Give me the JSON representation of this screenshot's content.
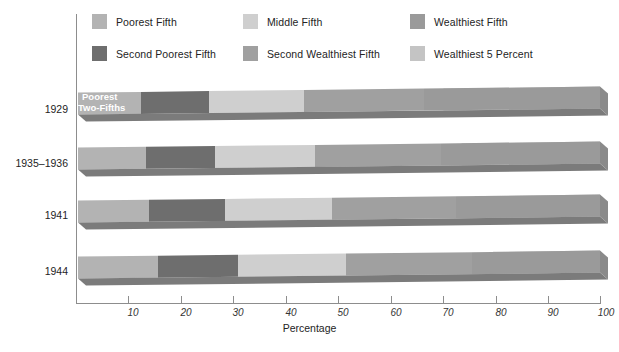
{
  "chart_data": {
    "type": "bar",
    "orientation": "horizontal-stacked-3d",
    "title": "",
    "xlabel": "Percentage",
    "ylabel": "",
    "xlim": [
      0,
      100
    ],
    "xticks": [
      10,
      20,
      30,
      40,
      50,
      60,
      70,
      80,
      90,
      100
    ],
    "grid": false,
    "legend_position": "top",
    "categories": [
      "1929",
      "1935–1936",
      "1941",
      "1944"
    ],
    "series": [
      {
        "name": "Poorest Fifth",
        "color": "#b3b3b3",
        "values": [
          12.0,
          13.0,
          13.5,
          15.0
        ]
      },
      {
        "name": "Second Poorest Fifth",
        "color": "#6e6e6e",
        "values": [
          13.0,
          13.0,
          14.5,
          15.0
        ]
      },
      {
        "name": "Middle Fifth",
        "color": "#cfcfcf",
        "values": [
          18.0,
          19.0,
          20.5,
          20.5
        ]
      },
      {
        "name": "Second Wealthiest Fifth",
        "color": "#a0a0a0",
        "values": [
          23.0,
          24.0,
          23.5,
          24.5
        ]
      },
      {
        "name": "Wealthiest Fifth",
        "color": "#9a9a9a",
        "values": [
          34.0,
          31.0,
          28.0,
          25.0
        ]
      }
    ],
    "overlay_series": {
      "name": "Wealthiest 5 Percent",
      "color": "#c4c4c4",
      "note": "shown as the lighter right-hand portion inside the Wealthiest Fifth band",
      "values": [
        30.0,
        26.5,
        24.0,
        20.5
      ]
    },
    "annotations": [
      {
        "text": "Poorest\nTwo-Fifths",
        "line1": "Poorest",
        "line2": "Two-Fifths",
        "attached_to": "1929",
        "color": "#ffffff"
      }
    ]
  },
  "legend": {
    "items": [
      {
        "label": "Poorest Fifth",
        "color": "#b3b3b3",
        "row": 0,
        "col": 0
      },
      {
        "label": "Middle Fifth",
        "color": "#cfcfcf",
        "row": 0,
        "col": 1
      },
      {
        "label": "Wealthiest Fifth",
        "color": "#9a9a9a",
        "row": 0,
        "col": 2
      },
      {
        "label": "Second Poorest Fifth",
        "color": "#6e6e6e",
        "row": 1,
        "col": 0
      },
      {
        "label": "Second Wealthiest Fifth",
        "color": "#a0a0a0",
        "row": 1,
        "col": 1
      },
      {
        "label": "Wealthiest 5 Percent",
        "color": "#c4c4c4",
        "row": 1,
        "col": 2
      }
    ]
  },
  "axis": {
    "x_title": "Percentage",
    "tick_labels": [
      "10",
      "20",
      "30",
      "40",
      "50",
      "60",
      "70",
      "80",
      "90",
      "100"
    ],
    "year_labels": [
      "1929",
      "1935–1936",
      "1941",
      "1944"
    ]
  },
  "annotation": {
    "poorest_two_fifths_line1": "Poorest",
    "poorest_two_fifths_line2": "Two-Fifths"
  },
  "colors": {
    "poorest_fifth": "#b3b3b3",
    "second_poorest_fifth": "#6e6e6e",
    "middle_fifth": "#cfcfcf",
    "second_wealthiest_fifth": "#a0a0a0",
    "wealthiest_fifth": "#9a9a9a",
    "wealthiest_5_percent": "#c4c4c4",
    "axis": "#8d8d8d",
    "shadow": "#6f6f6f",
    "background": "#ffffff"
  }
}
